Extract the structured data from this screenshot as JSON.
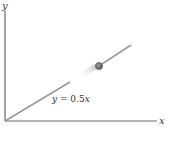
{
  "diagram": {
    "axes": {
      "x_label": "x",
      "y_label": "y",
      "color": "#555555"
    },
    "line": {
      "equation_lhs": "y",
      "equation_eq": " = 0.5",
      "equation_var": "x",
      "color": "#9a9a9a"
    },
    "ball": {
      "color": "#7a7a7a",
      "outline": "#555555"
    }
  }
}
